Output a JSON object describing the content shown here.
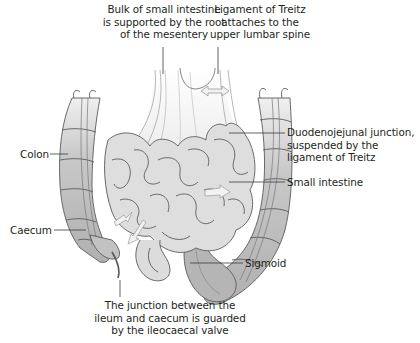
{
  "figure": {
    "colors": {
      "outline": "#5a5a5a",
      "small_intestine_fill": "#dedede",
      "colon_fill": "#c4c4c4",
      "colon_fill_dark": "#a9a9a9",
      "mesentery_fill": "#f4f4f4",
      "leader_line": "#3a3a3a",
      "arrow_fill": "#f2f2f2",
      "text": "#231f20"
    }
  },
  "labels": {
    "mesentery": {
      "line1": "Bulk of small intestine",
      "line2": "is supported by the root",
      "line3": "of the mesentery"
    },
    "treitz": {
      "line1": "Ligament of Treitz",
      "line2": "attaches to the",
      "line3": "upper lumbar spine"
    },
    "duodenojejunal": {
      "line1": "Duodenojejunal junction,",
      "line2": "suspended by the",
      "line3": "ligament of Treitz"
    },
    "small_intestine": "Small intestine",
    "colon": "Colon",
    "caecum": "Caecum",
    "sigmoid": "Sigmoid",
    "ileocaecal": {
      "line1": "The junction between the",
      "line2": "ileum and caecum is guarded",
      "line3": "by the ileocaecal valve"
    }
  }
}
